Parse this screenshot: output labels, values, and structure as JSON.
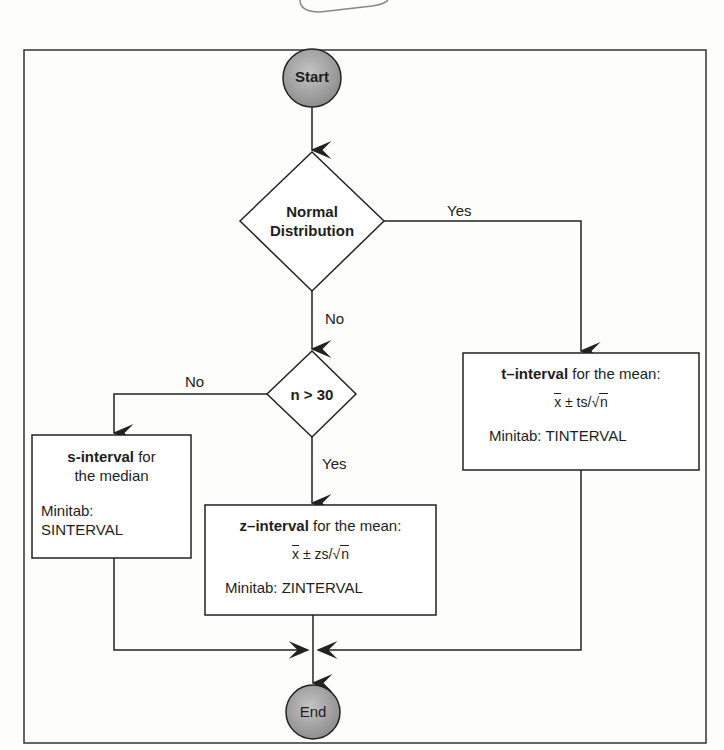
{
  "diagram": {
    "start": {
      "label": "Start"
    },
    "end": {
      "label": "End"
    },
    "decision_normal": {
      "line1": "Normal",
      "line2": "Distribution"
    },
    "decision_n": {
      "label": "n > 30"
    },
    "edges": {
      "normal_yes": "Yes",
      "normal_no": "No",
      "n_no": "No",
      "n_yes": "Yes"
    },
    "t_box": {
      "title_bold": "t–interval",
      "title_rest": " for the mean:",
      "formula_xbar": "x",
      "formula_mid": " ± ts/",
      "formula_sqrt_symbol": "√",
      "formula_n": "n",
      "minitab": "Minitab: TINTERVAL"
    },
    "z_box": {
      "title_bold": "z–interval",
      "title_rest": " for the mean:",
      "formula_xbar": "x",
      "formula_mid": " ± zs/",
      "formula_sqrt_symbol": "√",
      "formula_n": "n",
      "minitab": "Minitab: ZINTERVAL"
    },
    "s_box": {
      "title_bold": "s-interval",
      "title_rest": " for",
      "line2": "the median",
      "minitab_line1": "Minitab:",
      "minitab_line2": "SINTERVAL"
    }
  },
  "colors": {
    "line": "#2a2a2a",
    "terminal_fill": "#a8a8a8",
    "background": "#fdfdfb"
  }
}
